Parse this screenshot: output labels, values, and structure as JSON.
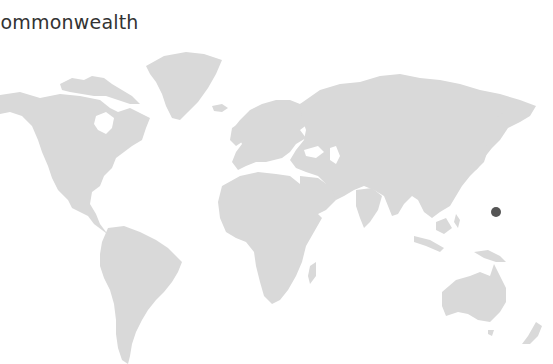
{
  "title": "Commonwealth",
  "map": {
    "projection": "world",
    "land_color": "#d9d9d9",
    "background_color": "#ffffff",
    "markers": [
      {
        "id": "marker-1",
        "x": 496,
        "y": 212,
        "radius": 5,
        "color": "#555555"
      }
    ]
  }
}
